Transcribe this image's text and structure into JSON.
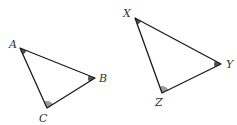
{
  "diagram": {
    "type": "similar-triangles",
    "triangles": [
      {
        "name": "ABC",
        "vertices": [
          {
            "label": "A",
            "angle_mark": "dark"
          },
          {
            "label": "B",
            "angle_mark": "dark"
          },
          {
            "label": "C",
            "angle_mark": "light"
          }
        ]
      },
      {
        "name": "XYZ",
        "vertices": [
          {
            "label": "X",
            "angle_mark": "dark"
          },
          {
            "label": "Y",
            "angle_mark": "dark"
          },
          {
            "label": "Z",
            "angle_mark": "light"
          }
        ]
      }
    ],
    "colors": {
      "edge": "#1a1a1a",
      "angle_dark": "#555555",
      "angle_light": "#9a9a9a",
      "label": "#333333"
    }
  }
}
